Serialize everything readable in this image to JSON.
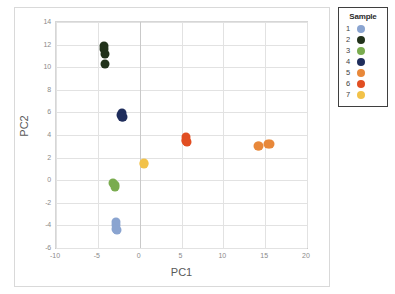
{
  "chart_data": {
    "type": "scatter",
    "title": "",
    "xlabel": "PC1",
    "ylabel": "PC2",
    "xlim": [
      -10,
      20
    ],
    "ylim": [
      -6,
      14
    ],
    "xticks": [
      "-10",
      "-5",
      "0",
      "5",
      "10",
      "15",
      "20"
    ],
    "xtick_values": [
      -10,
      -5,
      0,
      5,
      10,
      15,
      20
    ],
    "yticks": [
      "-6",
      "-4",
      "-2",
      "0",
      "2",
      "4",
      "6",
      "8",
      "10",
      "12",
      "14"
    ],
    "ytick_values": [
      -6,
      -4,
      -2,
      0,
      2,
      4,
      6,
      8,
      10,
      12,
      14
    ],
    "grid": true,
    "legend_position": "right",
    "legend_title": "Sample",
    "series": [
      {
        "name": "1",
        "color": "#8aa4d0",
        "points": [
          [
            -2.8,
            -3.7
          ],
          [
            -2.85,
            -3.95
          ],
          [
            -2.8,
            -4.35
          ],
          [
            -2.75,
            -4.45
          ]
        ]
      },
      {
        "name": "2",
        "color": "#22321b",
        "points": [
          [
            -4.3,
            11.9
          ],
          [
            -4.25,
            11.6
          ],
          [
            -4.2,
            11.15
          ],
          [
            -4.1,
            10.3
          ]
        ]
      },
      {
        "name": "3",
        "color": "#7aac4f",
        "points": [
          [
            -3.15,
            -0.25
          ],
          [
            -3.0,
            -0.45
          ],
          [
            -2.95,
            -0.6
          ]
        ]
      },
      {
        "name": "4",
        "color": "#1f2d5c",
        "points": [
          [
            -2.15,
            5.95
          ],
          [
            -2.2,
            5.75
          ],
          [
            -2.1,
            5.6
          ],
          [
            -2.05,
            5.55
          ]
        ]
      },
      {
        "name": "5",
        "color": "#e8883a",
        "points": [
          [
            14.1,
            3.05
          ],
          [
            14.3,
            3.05
          ],
          [
            15.3,
            3.2
          ],
          [
            15.55,
            3.2
          ]
        ]
      },
      {
        "name": "6",
        "color": "#e14e22",
        "points": [
          [
            5.5,
            3.8
          ],
          [
            5.55,
            3.6
          ],
          [
            5.5,
            3.45
          ],
          [
            5.6,
            3.4
          ]
        ]
      },
      {
        "name": "7",
        "color": "#f2c249",
        "points": [
          [
            0.5,
            1.55
          ],
          [
            0.55,
            1.45
          ]
        ]
      }
    ]
  },
  "legend": {
    "title": "Sample",
    "items": [
      {
        "label": "1",
        "color": "#8aa4d0"
      },
      {
        "label": "2",
        "color": "#22321b"
      },
      {
        "label": "3",
        "color": "#7aac4f"
      },
      {
        "label": "4",
        "color": "#1f2d5c"
      },
      {
        "label": "5",
        "color": "#e8883a"
      },
      {
        "label": "6",
        "color": "#e14e22"
      },
      {
        "label": "7",
        "color": "#f2c249"
      }
    ]
  }
}
